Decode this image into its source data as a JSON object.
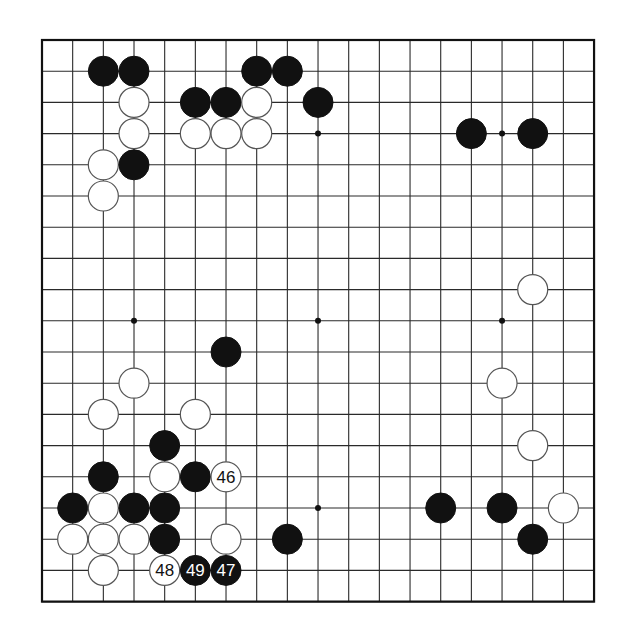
{
  "board": {
    "size": 19,
    "origin_x": 42,
    "origin_y": 40,
    "spacing_x": 30.67,
    "spacing_y": 31.2,
    "stone_radius": 15,
    "colors": {
      "black": "#111111",
      "white": "#ffffff",
      "line": "#2a2a2a"
    }
  },
  "star_points": [
    [
      3,
      3
    ],
    [
      9,
      3
    ],
    [
      15,
      3
    ],
    [
      3,
      9
    ],
    [
      9,
      9
    ],
    [
      15,
      9
    ],
    [
      3,
      15
    ],
    [
      9,
      15
    ],
    [
      15,
      15
    ]
  ],
  "stones": [
    {
      "color": "black",
      "col": 2,
      "row": 1
    },
    {
      "color": "black",
      "col": 3,
      "row": 1
    },
    {
      "color": "black",
      "col": 7,
      "row": 1
    },
    {
      "color": "black",
      "col": 8,
      "row": 1
    },
    {
      "color": "white",
      "col": 3,
      "row": 2
    },
    {
      "color": "black",
      "col": 5,
      "row": 2
    },
    {
      "color": "black",
      "col": 6,
      "row": 2
    },
    {
      "color": "white",
      "col": 7,
      "row": 2
    },
    {
      "color": "black",
      "col": 9,
      "row": 2
    },
    {
      "color": "white",
      "col": 3,
      "row": 3
    },
    {
      "color": "white",
      "col": 5,
      "row": 3
    },
    {
      "color": "white",
      "col": 6,
      "row": 3
    },
    {
      "color": "white",
      "col": 7,
      "row": 3
    },
    {
      "color": "black",
      "col": 14,
      "row": 3
    },
    {
      "color": "black",
      "col": 16,
      "row": 3
    },
    {
      "color": "white",
      "col": 2,
      "row": 4
    },
    {
      "color": "black",
      "col": 3,
      "row": 4
    },
    {
      "color": "white",
      "col": 2,
      "row": 5
    },
    {
      "color": "white",
      "col": 16,
      "row": 8
    },
    {
      "color": "black",
      "col": 6,
      "row": 10
    },
    {
      "color": "white",
      "col": 3,
      "row": 11
    },
    {
      "color": "white",
      "col": 15,
      "row": 11
    },
    {
      "color": "white",
      "col": 2,
      "row": 12
    },
    {
      "color": "white",
      "col": 5,
      "row": 12
    },
    {
      "color": "black",
      "col": 4,
      "row": 13
    },
    {
      "color": "white",
      "col": 16,
      "row": 13
    },
    {
      "color": "black",
      "col": 2,
      "row": 14
    },
    {
      "color": "white",
      "col": 4,
      "row": 14
    },
    {
      "color": "black",
      "col": 5,
      "row": 14
    },
    {
      "color": "white",
      "col": 6,
      "row": 14,
      "label": "46"
    },
    {
      "color": "black",
      "col": 1,
      "row": 15
    },
    {
      "color": "white",
      "col": 2,
      "row": 15
    },
    {
      "color": "black",
      "col": 3,
      "row": 15
    },
    {
      "color": "black",
      "col": 4,
      "row": 15
    },
    {
      "color": "black",
      "col": 13,
      "row": 15
    },
    {
      "color": "black",
      "col": 15,
      "row": 15
    },
    {
      "color": "white",
      "col": 17,
      "row": 15
    },
    {
      "color": "white",
      "col": 1,
      "row": 16
    },
    {
      "color": "white",
      "col": 2,
      "row": 16
    },
    {
      "color": "white",
      "col": 3,
      "row": 16
    },
    {
      "color": "black",
      "col": 4,
      "row": 16
    },
    {
      "color": "white",
      "col": 6,
      "row": 16
    },
    {
      "color": "black",
      "col": 8,
      "row": 16
    },
    {
      "color": "black",
      "col": 16,
      "row": 16
    },
    {
      "color": "white",
      "col": 2,
      "row": 17
    },
    {
      "color": "white",
      "col": 4,
      "row": 17,
      "label": "48"
    },
    {
      "color": "black",
      "col": 5,
      "row": 17,
      "label": "49"
    },
    {
      "color": "black",
      "col": 6,
      "row": 17,
      "label": "47"
    }
  ]
}
